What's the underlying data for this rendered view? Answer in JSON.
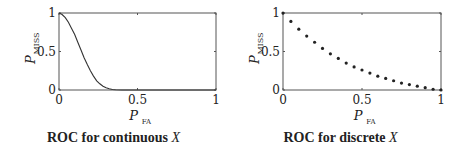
{
  "chart_data": [
    {
      "type": "line",
      "title": "ROC for continuous X",
      "caption_prefix": "ROC for continuous",
      "caption_var": "X",
      "xlabel": "P_FA",
      "ylabel": "P_MISS",
      "xlim": [
        0,
        1
      ],
      "ylim": [
        0,
        1
      ],
      "xticks": [
        "0",
        "0.5",
        "1"
      ],
      "yticks": [
        "0",
        "0.5",
        "1"
      ],
      "grid": false,
      "series": [
        {
          "name": "continuous ROC",
          "x": [
            0,
            0.02,
            0.04,
            0.06,
            0.08,
            0.1,
            0.12,
            0.14,
            0.16,
            0.18,
            0.2,
            0.22,
            0.24,
            0.26,
            0.28,
            0.3,
            0.32,
            0.34,
            0.36,
            0.4,
            0.5,
            0.6,
            0.8,
            1.0
          ],
          "y": [
            1.0,
            0.98,
            0.94,
            0.88,
            0.8,
            0.72,
            0.62,
            0.52,
            0.42,
            0.33,
            0.25,
            0.18,
            0.12,
            0.08,
            0.05,
            0.03,
            0.015,
            0.007,
            0.003,
            0.0,
            0.0,
            0.0,
            0.0,
            0.0
          ]
        }
      ]
    },
    {
      "type": "scatter",
      "title": "ROC for discrete X",
      "caption_prefix": "ROC for discrete",
      "caption_var": "X",
      "xlabel": "P_FA",
      "ylabel": "P_MISS",
      "xlim": [
        0,
        1
      ],
      "ylim": [
        0,
        1
      ],
      "xticks": [
        "0",
        "0.5",
        "1"
      ],
      "yticks": [
        "0",
        "0.5",
        "1"
      ],
      "grid": false,
      "series": [
        {
          "name": "discrete ROC",
          "x": [
            0,
            0.05,
            0.1,
            0.15,
            0.2,
            0.25,
            0.3,
            0.35,
            0.4,
            0.45,
            0.5,
            0.55,
            0.6,
            0.65,
            0.7,
            0.75,
            0.8,
            0.85,
            0.9,
            0.95,
            1.0
          ],
          "y": [
            1.0,
            0.89,
            0.79,
            0.7,
            0.62,
            0.54,
            0.47,
            0.41,
            0.35,
            0.3,
            0.26,
            0.22,
            0.18,
            0.15,
            0.12,
            0.09,
            0.07,
            0.05,
            0.03,
            0.01,
            0.0
          ]
        }
      ]
    }
  ],
  "labels": {
    "y_main": "P",
    "y_sub": "MISS",
    "x_main": "P",
    "x_sub": "FA"
  }
}
